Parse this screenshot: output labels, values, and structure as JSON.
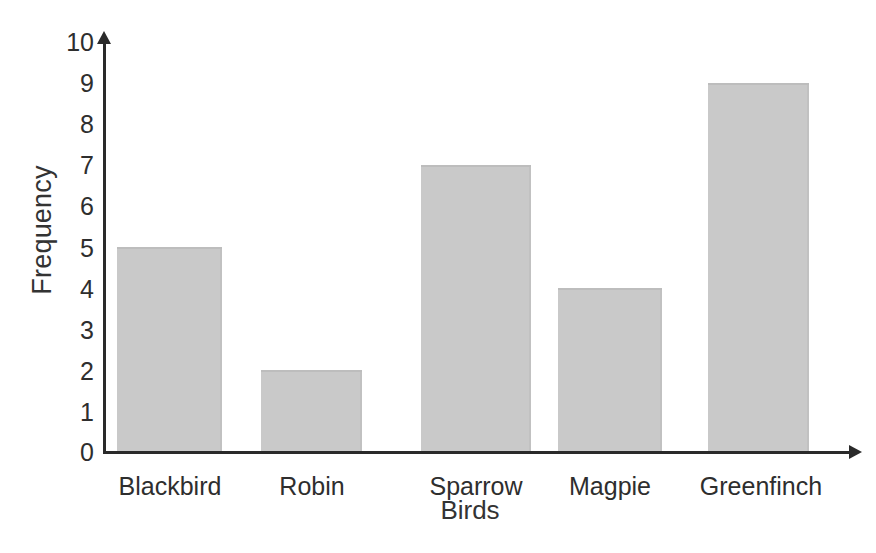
{
  "chart_data": {
    "type": "bar",
    "title": "",
    "xlabel": "Birds",
    "ylabel": "Frequency",
    "categories": [
      "Blackbird",
      "Robin",
      "Sparrow",
      "Magpie",
      "Greenfinch"
    ],
    "values": [
      5,
      2,
      7,
      4,
      9
    ],
    "yticks": [
      0,
      1,
      2,
      3,
      4,
      5,
      6,
      7,
      8,
      9,
      10
    ],
    "ylim": [
      0,
      10
    ],
    "grid": false,
    "legend": false,
    "legend_position": "none",
    "bar_color": "#c9c9c9",
    "axis_color": "#2a2a2a",
    "text_color": "#2e2e2e",
    "y_axis_arrow": true,
    "x_axis_arrow": true
  },
  "ylabels": {
    "t0": "0",
    "t1": "1",
    "t2": "2",
    "t3": "3",
    "t4": "4",
    "t5": "5",
    "t6": "6",
    "t7": "7",
    "t8": "8",
    "t9": "9",
    "t10": "10"
  },
  "xlabels": {
    "c0": "Blackbird",
    "c1": "Robin",
    "c2": "Sparrow",
    "c3": "Magpie",
    "c4": "Greenfinch"
  }
}
